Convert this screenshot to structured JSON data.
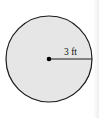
{
  "diagram": {
    "shape": "circle",
    "radius_label": "3 ft",
    "colors": {
      "fill": "#e6e6e6",
      "stroke": "#1a1a1a",
      "background": "#ffffff"
    }
  }
}
